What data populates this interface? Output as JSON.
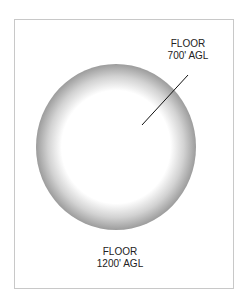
{
  "diagram": {
    "upper_label": {
      "line1": "FLOOR",
      "line2": "700' AGL"
    },
    "lower_label": {
      "line1": "FLOOR",
      "line2": "1200' AGL"
    },
    "colors": {
      "ring_outer": "#9a9a9a",
      "ring_inner": "#ffffff",
      "leader": "#111111",
      "frame": "#c8c8c8"
    }
  }
}
